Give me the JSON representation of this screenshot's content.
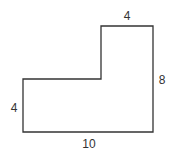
{
  "diagram": {
    "type": "L-shaped polygon with dimension labels",
    "shape_dimensions": {
      "total_width": 10,
      "total_height": 8,
      "top_width": 4,
      "left_height": 4
    },
    "labels": {
      "top": "4",
      "right": "8",
      "left": "4",
      "bottom": "10"
    },
    "stroke_color": "#333333"
  }
}
